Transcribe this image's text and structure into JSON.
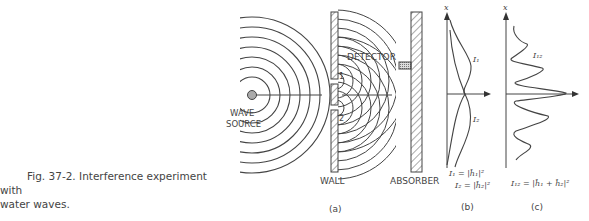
{
  "caption": {
    "line1": "Fig. 37-2.  Interference experiment with",
    "line2": "water waves."
  },
  "panel_a": {
    "wave_source_label_1": "WAVE",
    "wave_source_label_2": "SOURCE",
    "wall_label": "WALL",
    "detector_label": "DETECTOR",
    "absorber_label": "ABSORBER",
    "hole1_label": "1",
    "hole2_label": "2",
    "panel_label": "(a)"
  },
  "panel_b": {
    "axis_label": "x",
    "curve1_label": "I₁",
    "curve2_label": "I₂",
    "formula1": "I₁ = |ĥ₁|²",
    "formula2": "I₂ = |ĥ₂|²",
    "panel_label": "(b)"
  },
  "panel_c": {
    "axis_label": "x",
    "curve_label": "I₁₂",
    "formula": "I₁₂ = |ĥ₁ + ĥ₂|²",
    "panel_label": "(c)"
  }
}
